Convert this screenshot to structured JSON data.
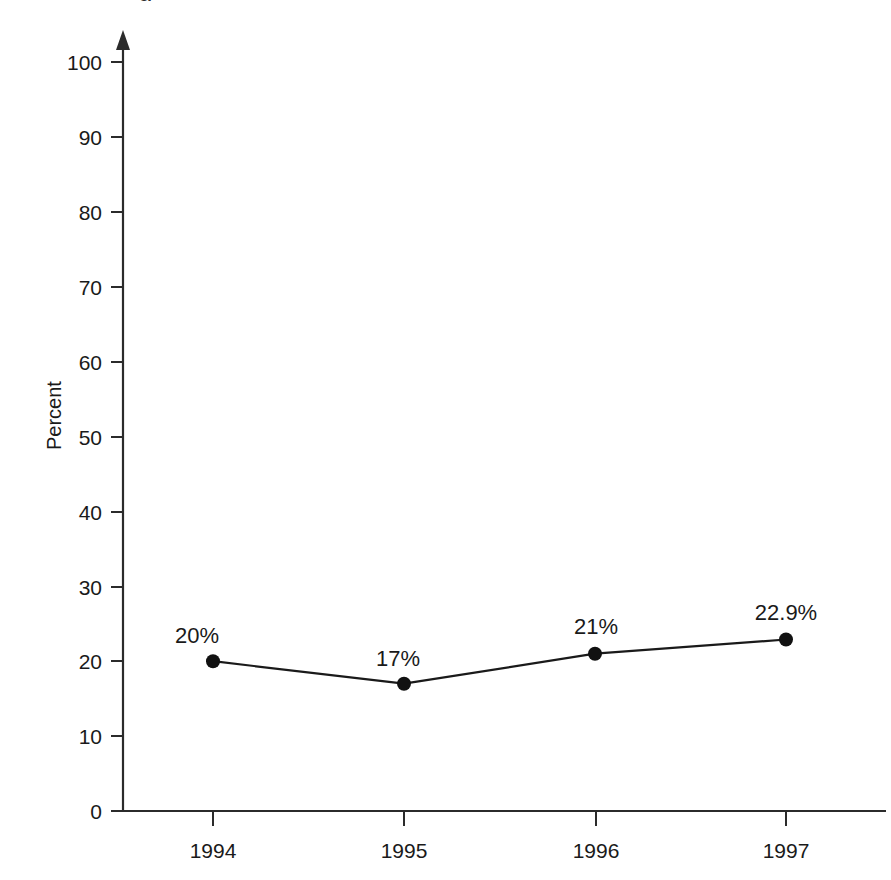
{
  "chart_data": {
    "type": "line",
    "title": "",
    "subtitle": "",
    "xlabel": "",
    "ylabel": "Percent",
    "categories": [
      "1994",
      "1995",
      "1996",
      "1997"
    ],
    "values": [
      20,
      17,
      21,
      22.9
    ],
    "point_labels": [
      "20%",
      "17%",
      "21%",
      "22.9%"
    ],
    "series": [
      {
        "name": "Percent",
        "values": [
          20,
          17,
          21,
          22.9
        ]
      }
    ],
    "ylim": [
      0,
      100
    ],
    "y_ticks": [
      "0",
      "10",
      "20",
      "30",
      "40",
      "50",
      "60",
      "70",
      "80",
      "90",
      "100"
    ],
    "y_tick_values": [
      0,
      10,
      20,
      30,
      40,
      50,
      60,
      70,
      80,
      90,
      100
    ],
    "x_ticks": [
      "1994",
      "1995",
      "1996",
      "1997"
    ],
    "grid": false,
    "legend": "none",
    "marker": "filled-circle",
    "axis_arrow": "up",
    "colors": {
      "line": "#1a1a1a",
      "marker": "#111111",
      "axis": "#2b2b2b",
      "text": "#1a1a1a",
      "background": "#ffffff"
    }
  },
  "cropped_header_fragment": "g"
}
